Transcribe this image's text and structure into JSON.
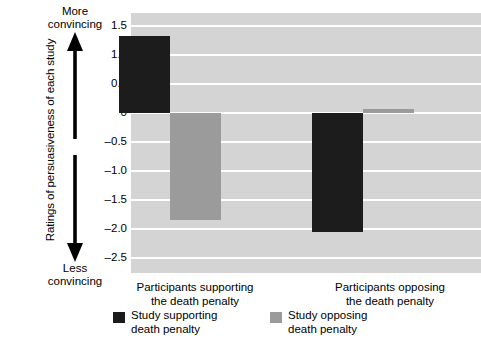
{
  "chart_data": {
    "type": "bar",
    "title": "",
    "xlabel": "",
    "ylabel": "Ratings of persuasiveness of each study",
    "categories": [
      "Participants supporting the death penalty",
      "Participants opposing the death penalty"
    ],
    "series": [
      {
        "name": "Study supporting death penalty",
        "color": "#1c1c1c",
        "values": [
          1.32,
          -2.05
        ]
      },
      {
        "name": "Study opposing death penalty",
        "color": "#9b9b9b",
        "values": [
          -1.84,
          0.07
        ]
      }
    ],
    "ylim": [
      -2.75,
      1.72
    ],
    "yticks": [
      1.5,
      1.0,
      0.5,
      0,
      -0.5,
      -1.0,
      -1.5,
      -2.0,
      -2.5
    ],
    "ytick_labels": [
      "1.5",
      "1.0",
      "0.5",
      "0",
      "–0.5",
      "–1.0",
      "–1.5",
      "–2.0",
      "–2.5"
    ],
    "grid": true,
    "grid_color": "#ffffff",
    "plot_background": "#d4d4d4",
    "legend_position": "bottom"
  },
  "axis": {
    "direction_top_line1": "More",
    "direction_top_line2": "convincing",
    "direction_bottom_line1": "Less",
    "direction_bottom_line2": "convincing",
    "arrow_name": "double-headed-vertical-arrow"
  },
  "xlabels": [
    {
      "line1": "Participants supporting",
      "line2": "the death penalty"
    },
    {
      "line1": "Participants opposing",
      "line2": "the death penalty"
    }
  ],
  "legend": [
    {
      "line1": "Study supporting",
      "line2": "death penalty",
      "swatch": "dark"
    },
    {
      "line1": "Study opposing",
      "line2": "death penalty",
      "swatch": "light"
    }
  ]
}
